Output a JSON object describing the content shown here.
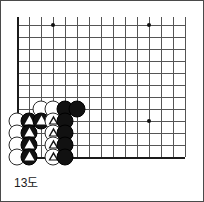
{
  "figure": {
    "caption": "13도",
    "type": "go-board-diagram",
    "colors": {
      "grid": "#555555",
      "edge": "#1a1a1a",
      "black_stone": "#111111",
      "white_stone": "#ffffff",
      "background": "#ffffff",
      "frame": "#4a4a4a"
    }
  },
  "board": {
    "origin_x": 16,
    "origin_y": 24,
    "spacing": 12,
    "cols": 15,
    "rows": 12,
    "left_edge_col": 0,
    "bottom_edge_row": 11,
    "star_points": [
      {
        "col": 3,
        "row": 0
      },
      {
        "col": 11,
        "row": 0
      },
      {
        "col": 11,
        "row": 8
      }
    ]
  },
  "stones": [
    {
      "col": 2,
      "row": 7,
      "color": "white",
      "mark": "none"
    },
    {
      "col": 3,
      "row": 7,
      "color": "white",
      "mark": "none"
    },
    {
      "col": 4,
      "row": 7,
      "color": "black",
      "mark": "none"
    },
    {
      "col": 5,
      "row": 7,
      "color": "black",
      "mark": "none"
    },
    {
      "col": 0,
      "row": 8,
      "color": "white",
      "mark": "none"
    },
    {
      "col": 1,
      "row": 8,
      "color": "black",
      "mark": "triangle"
    },
    {
      "col": 2,
      "row": 8,
      "color": "black",
      "mark": "triangle"
    },
    {
      "col": 3,
      "row": 8,
      "color": "white",
      "mark": "triangle"
    },
    {
      "col": 4,
      "row": 8,
      "color": "black",
      "mark": "none"
    },
    {
      "col": 0,
      "row": 9,
      "color": "white",
      "mark": "none"
    },
    {
      "col": 1,
      "row": 9,
      "color": "black",
      "mark": "triangle"
    },
    {
      "col": 3,
      "row": 9,
      "color": "white",
      "mark": "triangle"
    },
    {
      "col": 4,
      "row": 9,
      "color": "black",
      "mark": "none"
    },
    {
      "col": 0,
      "row": 10,
      "color": "white",
      "mark": "none"
    },
    {
      "col": 1,
      "row": 10,
      "color": "black",
      "mark": "triangle"
    },
    {
      "col": 3,
      "row": 10,
      "color": "white",
      "mark": "triangle"
    },
    {
      "col": 4,
      "row": 10,
      "color": "black",
      "mark": "none"
    },
    {
      "col": 0,
      "row": 11,
      "color": "white",
      "mark": "none"
    },
    {
      "col": 1,
      "row": 11,
      "color": "black",
      "mark": "triangle"
    },
    {
      "col": 3,
      "row": 11,
      "color": "white",
      "mark": "triangle"
    },
    {
      "col": 4,
      "row": 11,
      "color": "black",
      "mark": "none"
    }
  ]
}
